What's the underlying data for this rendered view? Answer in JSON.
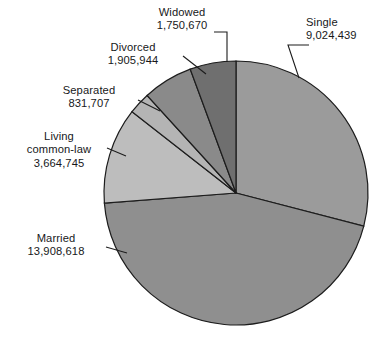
{
  "chart_data": {
    "type": "pie",
    "title": "",
    "subtitle": "",
    "xlabel": "",
    "ylabel": "",
    "legend_position": "none",
    "grid": false,
    "total": 31086123,
    "categories": [
      "Single",
      "Married",
      "Living common-law",
      "Separated",
      "Divorced",
      "Widowed"
    ],
    "values": [
      9024439,
      13908618,
      3664745,
      831707,
      1905944,
      1750670
    ],
    "value_labels": [
      "9,024,439",
      "13,908,618",
      "3,664,745",
      "831,707",
      "1,905,944",
      "1,750,670"
    ],
    "percents": [
      29.03,
      44.74,
      11.79,
      2.68,
      6.13,
      5.63
    ],
    "start_angle_deg": 0,
    "direction": "clockwise",
    "slices": [
      {
        "name": "Single",
        "label": "Single",
        "value": 9024439,
        "value_label": "9,024,439",
        "percent": 29.03,
        "color": "#9b9b9b",
        "start_deg": 0.0,
        "end_deg": 104.52
      },
      {
        "name": "Married",
        "label": "Married",
        "value": 13908618,
        "value_label": "13,908,618",
        "percent": 44.74,
        "color": "#8f8f8f",
        "start_deg": 104.52,
        "end_deg": 265.58
      },
      {
        "name": "Living common-law",
        "label": "Living common-law",
        "label_line1": "Living",
        "label_line2": "common-law",
        "value": 3664745,
        "value_label": "3,664,745",
        "percent": 11.79,
        "color": "#bdbdbd",
        "start_deg": 265.58,
        "end_deg": 308.02
      },
      {
        "name": "Separated",
        "label": "Separated",
        "value": 831707,
        "value_label": "831,707",
        "percent": 2.68,
        "color": "#b4b4b4",
        "start_deg": 308.02,
        "end_deg": 317.65
      },
      {
        "name": "Divorced",
        "label": "Divorced",
        "value": 1905944,
        "value_label": "1,905,944",
        "percent": 6.13,
        "color": "#8a8a8a",
        "start_deg": 317.65,
        "end_deg": 339.72
      },
      {
        "name": "Widowed",
        "label": "Widowed",
        "value": 1750670,
        "value_label": "1,750,670",
        "percent": 5.63,
        "color": "#6f6f6f",
        "start_deg": 339.72,
        "end_deg": 360.0
      }
    ],
    "geometry": {
      "center_x": 236,
      "center_y": 193,
      "radius": 132
    },
    "stroke_color": "#1c1c1c",
    "background": "#ffffff"
  }
}
